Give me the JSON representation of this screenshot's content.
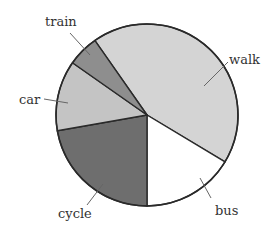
{
  "chart_data": {
    "type": "pie",
    "title": "",
    "unit": "percent (estimated from angles)",
    "start_angle_deg": -90,
    "direction": "clockwise",
    "categories": [
      "walk",
      "bus",
      "cycle",
      "car",
      "train"
    ],
    "values": [
      43,
      16,
      22,
      13,
      6
    ],
    "angles_deg": [
      156,
      59,
      80,
      45,
      20
    ],
    "colors": [
      "#d4d4d4",
      "#ffffff",
      "#6e6e6e",
      "#c4c4c4",
      "#8e8e8e"
    ],
    "labels": [
      {
        "text": "walk",
        "x": 229,
        "y": 64
      },
      {
        "text": "bus",
        "x": 215,
        "y": 215
      },
      {
        "text": "cycle",
        "x": 58,
        "y": 218
      },
      {
        "text": "car",
        "x": 19,
        "y": 104
      },
      {
        "text": "train",
        "x": 45,
        "y": 26
      }
    ],
    "legend": "none (direct labels with leader lines)",
    "grid": false
  }
}
